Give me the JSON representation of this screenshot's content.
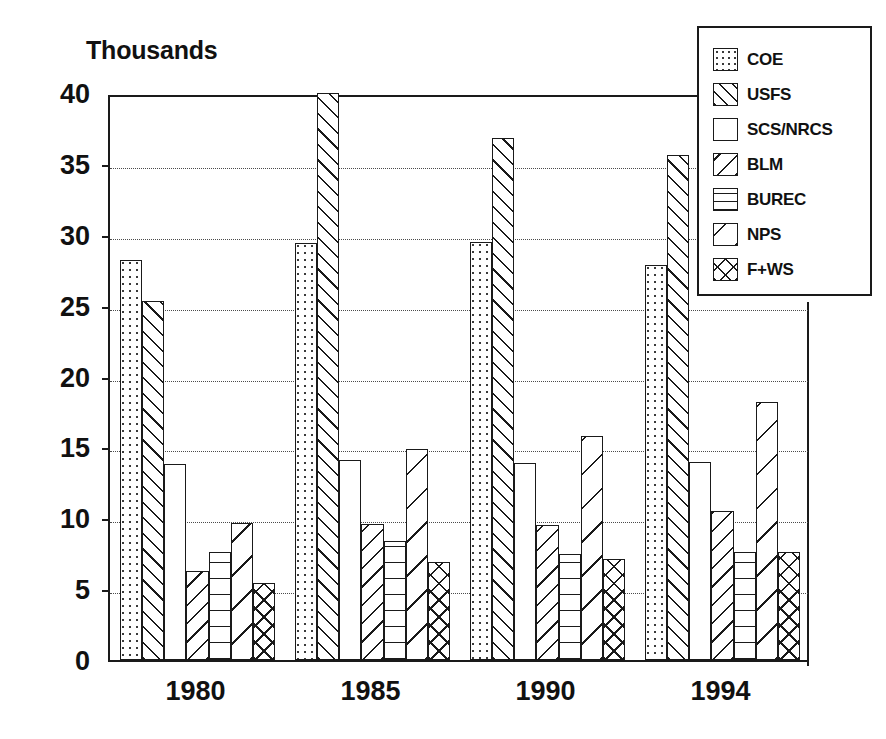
{
  "chart_data": {
    "type": "bar",
    "title": "Thousands",
    "xlabel": "",
    "ylabel": "",
    "ylim": [
      0,
      40
    ],
    "ytick_values": [
      0,
      5,
      10,
      15,
      20,
      25,
      30,
      35,
      40
    ],
    "ytick_labels": [
      "0",
      "5",
      "10",
      "15",
      "20",
      "25",
      "30",
      "35",
      "40"
    ],
    "grid": true,
    "grid_axis": "y",
    "legend_position": "top-right",
    "categories": [
      "1980",
      "1985",
      "1990",
      "1994"
    ],
    "series": [
      {
        "name": "COE",
        "pattern": "dotted",
        "values": [
          28.2,
          29.4,
          29.5,
          27.9
        ]
      },
      {
        "name": "USFS",
        "pattern": "diag-fwd-dense",
        "values": [
          25.3,
          40.0,
          36.8,
          35.6
        ]
      },
      {
        "name": "SCS/NRCS",
        "pattern": "empty",
        "values": [
          13.8,
          14.1,
          13.9,
          14.0
        ]
      },
      {
        "name": "BLM",
        "pattern": "diag-back",
        "values": [
          6.3,
          9.6,
          9.5,
          10.5
        ]
      },
      {
        "name": "BUREC",
        "pattern": "horiz",
        "values": [
          7.6,
          8.4,
          7.5,
          7.6
        ]
      },
      {
        "name": "NPS",
        "pattern": "diag-back-sparse",
        "values": [
          9.7,
          14.9,
          15.8,
          18.2
        ]
      },
      {
        "name": "F+WS",
        "pattern": "cross",
        "values": [
          5.4,
          6.9,
          7.1,
          7.6
        ]
      }
    ]
  },
  "legend": {
    "items": [
      {
        "label": "COE",
        "pattern": "dotted"
      },
      {
        "label": "USFS",
        "pattern": "diag-fwd-dense"
      },
      {
        "label": "SCS/NRCS",
        "pattern": "empty"
      },
      {
        "label": "BLM",
        "pattern": "diag-back"
      },
      {
        "label": "BUREC",
        "pattern": "horiz"
      },
      {
        "label": "NPS",
        "pattern": "diag-back-sparse"
      },
      {
        "label": "F+WS",
        "pattern": "cross"
      }
    ]
  },
  "colors": {
    "ink": "#1a1a1a",
    "background": "#ffffff",
    "gridline": "#4b4b4b"
  }
}
